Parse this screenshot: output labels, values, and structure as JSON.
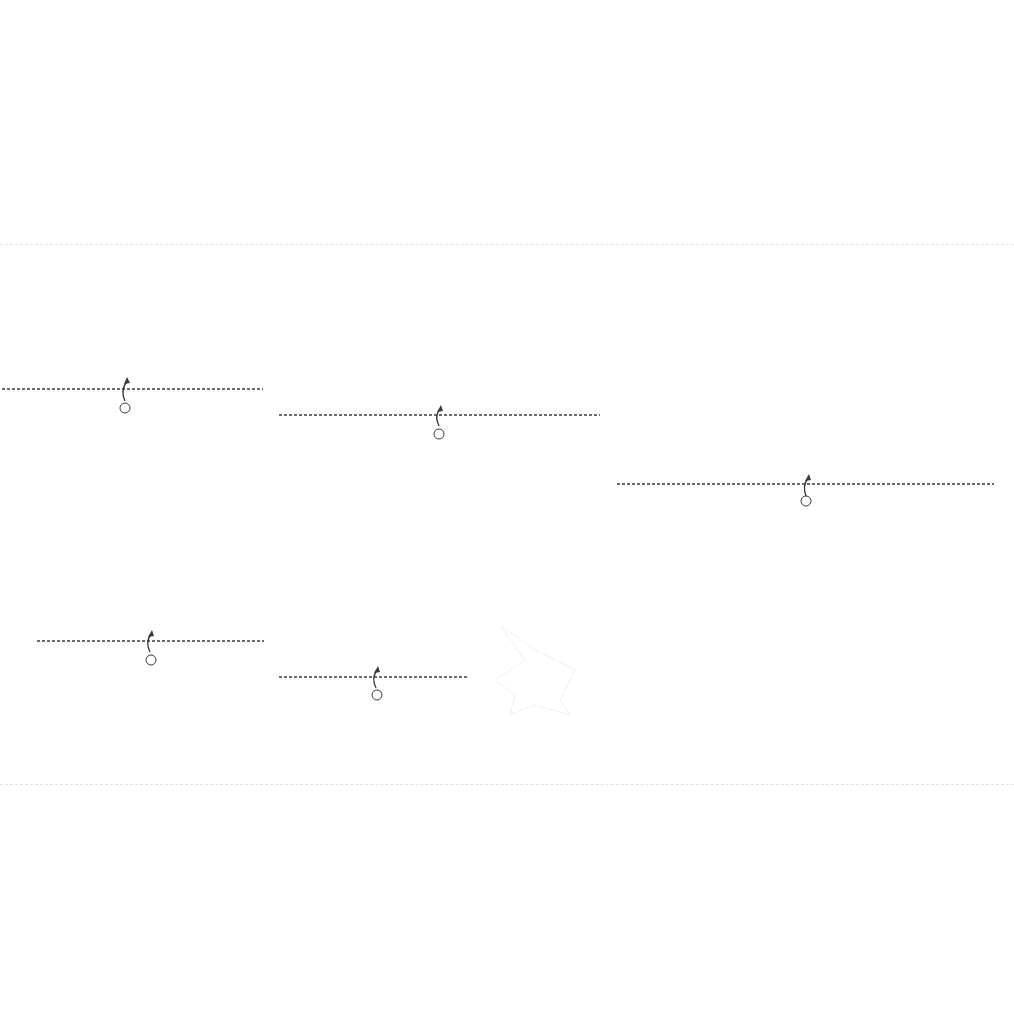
{
  "diagram": {
    "rows": [
      {
        "name": "top-row",
        "sheets": [
          {
            "fill": "#e3e3e3",
            "labels": [
              "2",
              "1",
              "1"
            ]
          },
          {
            "fill": "#9b9b9b",
            "labels": [
              "2",
              "1",
              "1"
            ]
          },
          {
            "fill": "#c6c6c6",
            "labels": [
              "2",
              "1",
              "1"
            ]
          },
          {
            "fill": "#cdcdcd",
            "labels": [
              "2",
              "1",
              "1"
            ]
          },
          {
            "fill": "#8a8a8a",
            "labels": [
              "2",
              "1",
              "1"
            ]
          },
          {
            "fill": "#b8b8b8",
            "labels": [
              "2",
              "1",
              "1"
            ]
          }
        ]
      },
      {
        "name": "middle-group",
        "sheets": [
          {
            "fill": "#8e8e8e",
            "label": "1"
          },
          {
            "fill": "#ababab",
            "label": "1"
          },
          {
            "fill": "#8d8d8d",
            "label": "1"
          },
          {
            "fill": "#949494",
            "label": "1"
          },
          {
            "fill": "#a7a7a7",
            "label": "1"
          }
        ]
      },
      {
        "name": "bottom-row",
        "sheets": [
          {
            "fill": "#6c6c6c",
            "label": "1"
          },
          {
            "fill": "#8e8e8e",
            "label": "1"
          },
          {
            "fill": "#d2d2d2",
            "label": "1"
          },
          {
            "fill": "#8f8f8f",
            "label": "1"
          }
        ]
      }
    ],
    "legend": {
      "valley_fold": "dashed line",
      "fold_arrow": "curved arrow",
      "step_marker": "circled number"
    },
    "colors": {
      "line": "#3a3a3a",
      "background": "#ffffff"
    }
  }
}
